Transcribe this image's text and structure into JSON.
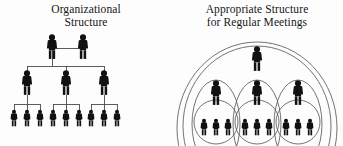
{
  "figure": {
    "background_color": "#fdfdfd",
    "ink_color": "#111111",
    "line_color": "#3a3a3a",
    "panels": [
      {
        "id": "organizational-structure",
        "title": "Organizational\nStructure",
        "description": "Hierarchical org chart: two co-leaders at top linked by a horizontal line, three managers below, and nine staff figures in three groups of three.",
        "levels": [
          {
            "name": "top-leaders",
            "count": 2,
            "figure_size": "large"
          },
          {
            "name": "managers",
            "count": 3,
            "figure_size": "large"
          },
          {
            "name": "staff",
            "count": 9,
            "figure_size": "small",
            "groups": 3,
            "per_group": 3
          }
        ],
        "connector_style": "orthogonal-lines"
      },
      {
        "id": "appropriate-structure-for-regular-meetings",
        "title": "Appropriate Structure\nfor Regular Meetings",
        "description": "Nested-ellipse meeting structure: one leader inside a large outer ellipse that encloses three team ellipses, each holding a manager and three staff figures.",
        "levels": [
          {
            "name": "top-leader",
            "count": 1,
            "figure_size": "large"
          },
          {
            "name": "managers",
            "count": 3,
            "figure_size": "large"
          },
          {
            "name": "staff",
            "count": 9,
            "figure_size": "small",
            "groups": 3,
            "per_group": 3
          }
        ],
        "enclosures": [
          {
            "name": "outer-ellipse",
            "contains": "all figures"
          },
          {
            "name": "team-ellipse-left",
            "contains": "manager + 3 staff"
          },
          {
            "name": "team-ellipse-center",
            "contains": "manager + 3 staff"
          },
          {
            "name": "team-ellipse-right",
            "contains": "manager + 3 staff"
          }
        ],
        "connector_style": "none"
      }
    ]
  }
}
